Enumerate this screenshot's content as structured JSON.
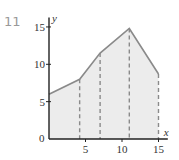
{
  "problem_number": "11",
  "chart_data": {
    "type": "area",
    "title": "",
    "xlabel": "x",
    "ylabel": "y",
    "xlim": [
      0,
      16
    ],
    "ylim": [
      0,
      16
    ],
    "x_ticks": [
      5,
      10,
      15
    ],
    "y_ticks": [
      5,
      10,
      15
    ],
    "origin_label": "0",
    "grid": false,
    "x": [
      0,
      4.2,
      7,
      11,
      15
    ],
    "y": [
      6,
      8,
      11.5,
      14.8,
      8.7
    ],
    "dashed_verticals_at": [
      4.2,
      7,
      11,
      15
    ],
    "colors": {
      "line": "#8a8a8a",
      "fill": "#ececec",
      "axis": "#222222",
      "dash": "#8a8a8a"
    }
  }
}
